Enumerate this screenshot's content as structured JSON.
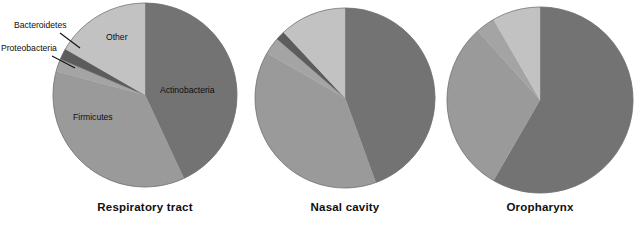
{
  "figure": {
    "background": "#ffffff",
    "caption_color": "#101010"
  },
  "colors": {
    "actinobacteria": "#737373",
    "firmicutes": "#9a9a9a",
    "proteobacteria": "#a4a4a4",
    "bacteroidetes": "#5c5c5c",
    "other": "#c2c2c2",
    "outline": "#6f6f6f"
  },
  "annotations": {
    "bacteroidetes_label": "Bacteroidetes",
    "proteobacteria_label": "Proteobacteria",
    "other_label": "Other",
    "actinobacteria_label": "Actinobacteria",
    "firmicutes_label": "Firmicutes"
  },
  "chart_data": {
    "type": "pie",
    "title": "",
    "legend_position": "in-slice-labels",
    "categories": [
      "Actinobacteria",
      "Firmicutes",
      "Proteobacteria",
      "Bacteroidetes",
      "Other"
    ],
    "category_colors": [
      "#737373",
      "#9a9a9a",
      "#a4a4a4",
      "#5c5c5c",
      "#c2c2c2"
    ],
    "units": "percent",
    "start_angle_deg": 0,
    "direction": "clockwise",
    "charts": [
      {
        "name": "Respiratory tract",
        "label": "Respiratory tract",
        "center": [
          145,
          95
        ],
        "radius": 92,
        "values": [
          43.0,
          36.0,
          2.2,
          1.9,
          16.9
        ],
        "slices": [
          {
            "category": "Actinobacteria",
            "value": 43.0,
            "start_deg": 0,
            "end_deg": 155,
            "color": "#737373",
            "label": "Actinobacteria",
            "label_xy": [
              160,
              90
            ]
          },
          {
            "category": "Firmicutes",
            "value": 36.0,
            "start_deg": 155,
            "end_deg": 285,
            "color": "#9a9a9a",
            "label": "Firmicutes",
            "label_xy": [
              73,
              117
            ]
          },
          {
            "category": "Proteobacteria",
            "value": 2.2,
            "start_deg": 285,
            "end_deg": 293,
            "color": "#a4a4a4",
            "label": "Proteobacteria",
            "label_xy": [
              2,
              48
            ]
          },
          {
            "category": "Bacteroidetes",
            "value": 1.9,
            "start_deg": 293,
            "end_deg": 300,
            "color": "#5c5c5c",
            "label": "Bacteroidetes",
            "label_xy": [
              22,
              25
            ]
          },
          {
            "category": "Other",
            "value": 16.9,
            "start_deg": 300,
            "end_deg": 360,
            "color": "#c2c2c2",
            "label": "Other",
            "label_xy": [
              106,
              36
            ]
          }
        ]
      },
      {
        "name": "Nasal cavity",
        "label": "Nasal cavity",
        "center": [
          345,
          98
        ],
        "radius": 90,
        "values": [
          44.4,
          38.9,
          3.1,
          1.7,
          11.9
        ],
        "slices": [
          {
            "category": "Actinobacteria",
            "value": 44.4,
            "start_deg": 0,
            "end_deg": 160,
            "color": "#737373"
          },
          {
            "category": "Firmicutes",
            "value": 38.9,
            "start_deg": 160,
            "end_deg": 300,
            "color": "#9a9a9a"
          },
          {
            "category": "Proteobacteria",
            "value": 3.1,
            "start_deg": 300,
            "end_deg": 311,
            "color": "#a4a4a4"
          },
          {
            "category": "Bacteroidetes",
            "value": 1.7,
            "start_deg": 311,
            "end_deg": 317,
            "color": "#5c5c5c"
          },
          {
            "category": "Other",
            "value": 11.9,
            "start_deg": 317,
            "end_deg": 360,
            "color": "#c2c2c2"
          }
        ]
      },
      {
        "name": "Oropharynx",
        "label": "Oropharynx",
        "center": [
          540,
          100
        ],
        "radius": 93,
        "values": [
          58.3,
          30.0,
          3.3,
          0.0,
          8.4
        ],
        "slices": [
          {
            "category": "Actinobacteria",
            "value": 58.3,
            "start_deg": 0,
            "end_deg": 210,
            "color": "#737373"
          },
          {
            "category": "Firmicutes",
            "value": 30.0,
            "start_deg": 210,
            "end_deg": 318,
            "color": "#9a9a9a"
          },
          {
            "category": "Proteobacteria",
            "value": 3.3,
            "start_deg": 318,
            "end_deg": 330,
            "color": "#a4a4a4"
          },
          {
            "category": "Other",
            "value": 8.4,
            "start_deg": 330,
            "end_deg": 360,
            "color": "#c2c2c2"
          }
        ]
      }
    ]
  }
}
